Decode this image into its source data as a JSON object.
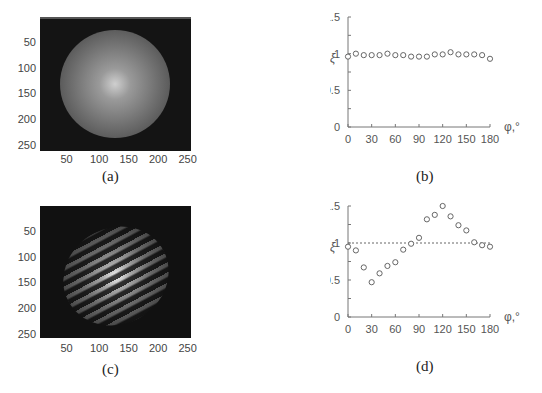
{
  "figure": {
    "panels": [
      {
        "id": "a",
        "caption": "(a)",
        "type": "image",
        "description": "Grayscale intensity image of a bright circular disk on a dark background, brightest at the center",
        "x_ticks": [
          "50",
          "100",
          "150",
          "200",
          "250"
        ],
        "y_ticks": [
          "50",
          "100",
          "150",
          "200",
          "250"
        ]
      },
      {
        "id": "c",
        "caption": "(c)",
        "type": "image",
        "description": "Grayscale intensity image of a circular region filled with diagonal interference fringes on a dark background",
        "x_ticks": [
          "50",
          "100",
          "150",
          "200",
          "250"
        ],
        "y_ticks": [
          "50",
          "100",
          "150",
          "200",
          "250"
        ]
      }
    ]
  },
  "chart_data": [
    {
      "id": "b",
      "caption": "(b)",
      "type": "scatter",
      "title": "",
      "xlabel": "φ,°",
      "ylabel": "ξ",
      "xlim": [
        0,
        180
      ],
      "ylim": [
        0,
        1.5
      ],
      "x_ticks": [
        "0",
        "30",
        "60",
        "90",
        "120",
        "150",
        "180"
      ],
      "y_ticks": [
        "0",
        "0.5",
        "1",
        "1.5"
      ],
      "reference_line": null,
      "grid": false,
      "x": [
        0,
        10,
        20,
        30,
        40,
        50,
        60,
        70,
        80,
        90,
        100,
        110,
        120,
        130,
        140,
        150,
        160,
        170,
        180
      ],
      "y": [
        0.96,
        1.0,
        0.98,
        0.98,
        0.98,
        1.0,
        0.98,
        0.98,
        0.96,
        0.96,
        0.96,
        0.99,
        0.99,
        1.02,
        0.99,
        0.99,
        0.99,
        0.98,
        0.93
      ]
    },
    {
      "id": "d",
      "caption": "(d)",
      "type": "scatter",
      "title": "",
      "xlabel": "φ,°",
      "ylabel": "ξ",
      "xlim": [
        0,
        180
      ],
      "ylim": [
        0,
        1.5
      ],
      "x_ticks": [
        "0",
        "30",
        "60",
        "90",
        "120",
        "150",
        "180"
      ],
      "y_ticks": [
        "0",
        "0.5",
        "1",
        "1.5"
      ],
      "reference_line": 1.0,
      "grid": false,
      "x": [
        0,
        10,
        20,
        30,
        40,
        50,
        60,
        70,
        80,
        90,
        100,
        110,
        120,
        130,
        140,
        150,
        160,
        170,
        180
      ],
      "y": [
        0.95,
        0.9,
        0.67,
        0.47,
        0.59,
        0.69,
        0.74,
        0.91,
        0.99,
        1.07,
        1.32,
        1.38,
        1.5,
        1.36,
        1.24,
        1.17,
        1.01,
        0.97,
        0.95
      ]
    }
  ]
}
